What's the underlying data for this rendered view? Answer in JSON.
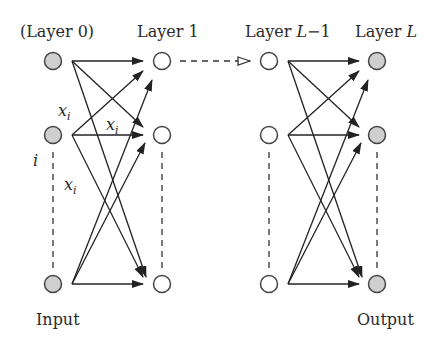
{
  "diagram": {
    "layers": [
      {
        "label": "(Layer 0)",
        "label_parts": [
          "(Layer 0)"
        ],
        "role": "input",
        "node_fill": "#cfcfcf",
        "bottom_label": "Input"
      },
      {
        "label": "Layer 1",
        "label_parts": [
          "Layer 1"
        ],
        "role": "hidden",
        "node_fill": "#ffffff"
      },
      {
        "label": "Layer L−1",
        "label_parts": [
          "Layer ",
          "L",
          "−1"
        ],
        "role": "hidden",
        "node_fill": "#ffffff"
      },
      {
        "label": "Layer L",
        "label_parts": [
          "Layer ",
          "L"
        ],
        "role": "output",
        "node_fill": "#cfcfcf",
        "bottom_label": "Output"
      }
    ],
    "annotations": {
      "xi_label": "x",
      "xi_subscript": "i",
      "index_label": "i"
    },
    "bottom_labels": {
      "input": "Input",
      "output": "Output"
    },
    "connector": "dashed-open-arrow between Layer 1 and Layer L−1",
    "colors": {
      "stroke": "#222222",
      "shaded_node": "#cfcfcf",
      "open_node": "#ffffff",
      "text": "#2a2a2a"
    }
  }
}
